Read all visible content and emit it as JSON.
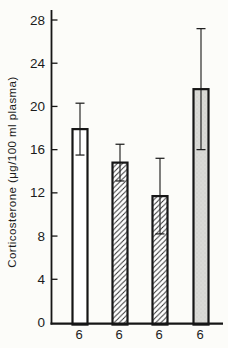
{
  "page": {
    "background": "#fcfcf9",
    "ink_color": "#161616"
  },
  "chart_data": {
    "type": "bar",
    "title": "",
    "ylabel": "Corticosterone (μg/100 ml plasma)",
    "xlabel": "",
    "ylim": [
      0,
      28
    ],
    "yticks": [
      0,
      4,
      8,
      12,
      16,
      20,
      24,
      28
    ],
    "y_unit": "μg/100 ml plasma",
    "categories": [
      "6",
      "6",
      "6",
      "6"
    ],
    "bars": [
      {
        "group_n_label": "6",
        "value": 17.9,
        "error": 2.4,
        "fill_style": "open"
      },
      {
        "group_n_label": "6",
        "value": 14.8,
        "error": 1.7,
        "fill_style": "hatched"
      },
      {
        "group_n_label": "6",
        "value": 11.7,
        "error": 3.5,
        "fill_style": "hatched"
      },
      {
        "group_n_label": "6",
        "value": 21.6,
        "error": 5.6,
        "fill_style": "stippled"
      }
    ],
    "error_bar_style": "symmetric-capped",
    "grid": false,
    "legend": null,
    "fill_colors": {
      "open": "#ffffff",
      "hatch_line": "#2e2e2e",
      "stippled": "#dadad6"
    }
  }
}
